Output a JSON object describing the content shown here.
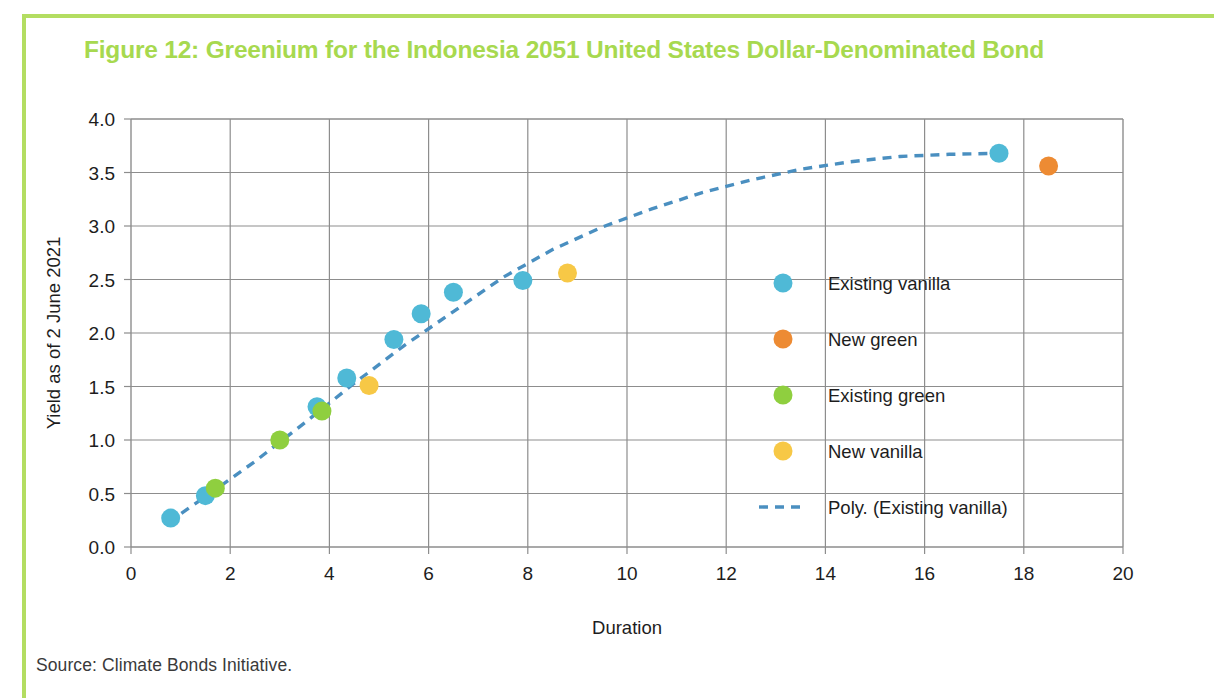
{
  "figure": {
    "title": "Figure 12: Greenium for the Indonesia 2051 United States Dollar-Denominated Bond",
    "title_color": "#a7d94f",
    "source": "Source: Climate Bonds Initiative.",
    "frame_color": "#b3dd61"
  },
  "chart_data": {
    "type": "scatter",
    "title": "Figure 12: Greenium for the Indonesia 2051 United States Dollar-Denominated Bond",
    "xlabel": "Duration",
    "ylabel": "Yield as of 2 June 2021",
    "xlim": [
      0,
      20
    ],
    "ylim": [
      0,
      4.0
    ],
    "xticks": [
      0,
      2,
      4,
      6,
      8,
      10,
      12,
      14,
      16,
      18,
      20
    ],
    "yticks": [
      0.0,
      0.5,
      1.0,
      1.5,
      2.0,
      2.5,
      3.0,
      3.5,
      4.0
    ],
    "xtick_labels": [
      "0",
      "2",
      "4",
      "6",
      "8",
      "10",
      "12",
      "14",
      "16",
      "18",
      "20"
    ],
    "ytick_labels": [
      "0.0",
      "0.5",
      "1.0",
      "1.5",
      "2.0",
      "2.5",
      "3.0",
      "3.5",
      "4.0"
    ],
    "grid": true,
    "legend_position": "center right",
    "series": [
      {
        "name": "Existing vanilla",
        "marker": "circle",
        "color": "#4fb9d6",
        "points": [
          {
            "x": 0.8,
            "y": 0.27
          },
          {
            "x": 1.5,
            "y": 0.48
          },
          {
            "x": 3.75,
            "y": 1.31
          },
          {
            "x": 4.35,
            "y": 1.58
          },
          {
            "x": 5.3,
            "y": 1.94
          },
          {
            "x": 5.85,
            "y": 2.18
          },
          {
            "x": 6.5,
            "y": 2.38
          },
          {
            "x": 7.9,
            "y": 2.49
          },
          {
            "x": 17.5,
            "y": 3.68
          }
        ]
      },
      {
        "name": "New green",
        "marker": "circle",
        "color": "#ed8b33",
        "points": [
          {
            "x": 18.5,
            "y": 3.56
          }
        ]
      },
      {
        "name": "Existing green",
        "marker": "circle",
        "color": "#8fcf3f",
        "points": [
          {
            "x": 1.7,
            "y": 0.55
          },
          {
            "x": 3.0,
            "y": 1.0
          },
          {
            "x": 3.85,
            "y": 1.27
          }
        ]
      },
      {
        "name": "New vanilla",
        "marker": "circle",
        "color": "#f7c846",
        "points": [
          {
            "x": 4.8,
            "y": 1.51
          },
          {
            "x": 8.8,
            "y": 2.56
          }
        ]
      },
      {
        "name": "Poly. (Existing vanilla)",
        "type": "trendline",
        "style": "dashed",
        "color": "#4a8fc0",
        "points": [
          {
            "x": 0.75,
            "y": 0.23
          },
          {
            "x": 1.5,
            "y": 0.47
          },
          {
            "x": 2.5,
            "y": 0.8
          },
          {
            "x": 3.5,
            "y": 1.16
          },
          {
            "x": 4.5,
            "y": 1.53
          },
          {
            "x": 5.5,
            "y": 1.88
          },
          {
            "x": 6.5,
            "y": 2.2
          },
          {
            "x": 7.5,
            "y": 2.52
          },
          {
            "x": 8.5,
            "y": 2.78
          },
          {
            "x": 9.5,
            "y": 2.99
          },
          {
            "x": 10.5,
            "y": 3.16
          },
          {
            "x": 11.5,
            "y": 3.31
          },
          {
            "x": 12.5,
            "y": 3.43
          },
          {
            "x": 13.5,
            "y": 3.53
          },
          {
            "x": 14.5,
            "y": 3.6
          },
          {
            "x": 15.5,
            "y": 3.65
          },
          {
            "x": 16.5,
            "y": 3.67
          },
          {
            "x": 17.5,
            "y": 3.68
          }
        ]
      }
    ],
    "legend": [
      {
        "label": "Existing vanilla",
        "color": "#4fb9d6",
        "marker": "circle"
      },
      {
        "label": "New green",
        "color": "#ed8b33",
        "marker": "circle"
      },
      {
        "label": "Existing green",
        "color": "#8fcf3f",
        "marker": "circle"
      },
      {
        "label": "New vanilla",
        "color": "#f7c846",
        "marker": "circle"
      },
      {
        "label": "Poly. (Existing vanilla)",
        "color": "#4a8fc0",
        "marker": "dashed-line"
      }
    ]
  }
}
